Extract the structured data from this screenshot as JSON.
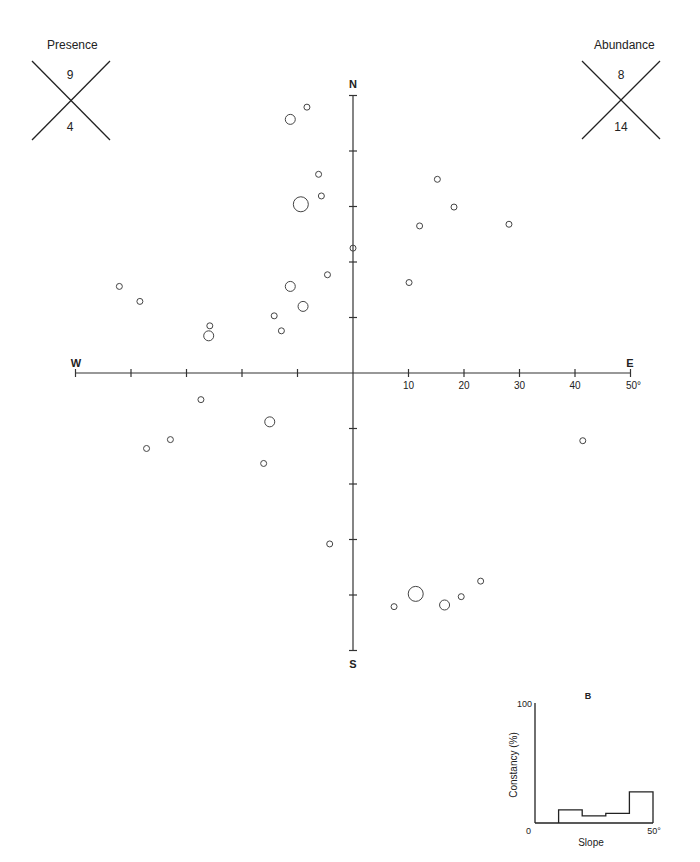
{
  "presence_key": {
    "title": "Presence",
    "upper": "9",
    "lower": "4"
  },
  "abundance_key": {
    "title": "Abundance",
    "upper": "8",
    "lower": "14"
  },
  "compass": {
    "north": "N",
    "south": "S",
    "west": "W",
    "east": "E"
  },
  "histogram": {
    "panel_label": "B",
    "ylabel": "Constancy (%)",
    "xlabel": "Slope",
    "y_top_label": "100",
    "y_zero_label": "0",
    "x_end_label": "50°"
  },
  "chart_data": [
    {
      "type": "scatter",
      "title": "",
      "description": "Polar-style aspect/slope plot: horizontal axis W–E, vertical axis N–S, distance from center = slope in degrees; circle size = abundance",
      "xlabel": "W — E",
      "ylabel": "S — N",
      "axis_tick_labels": [
        "10",
        "20",
        "30",
        "40",
        "50°"
      ],
      "axis_range": [
        -50,
        50
      ],
      "tick_step": 10,
      "grid": false,
      "size_classes": [
        "small",
        "medium",
        "large"
      ],
      "points": [
        {
          "x": -8.3,
          "y": 47.9,
          "size": "small"
        },
        {
          "x": -11.3,
          "y": 45.7,
          "size": "medium"
        },
        {
          "x": -6.2,
          "y": 35.8,
          "size": "small"
        },
        {
          "x": -5.7,
          "y": 31.9,
          "size": "small"
        },
        {
          "x": -9.4,
          "y": 30.4,
          "size": "large"
        },
        {
          "x": 0.0,
          "y": 22.5,
          "size": "small"
        },
        {
          "x": -4.6,
          "y": 17.7,
          "size": "small"
        },
        {
          "x": -11.3,
          "y": 15.6,
          "size": "medium"
        },
        {
          "x": -9.0,
          "y": 12.0,
          "size": "medium"
        },
        {
          "x": -14.2,
          "y": 10.3,
          "size": "small"
        },
        {
          "x": -12.9,
          "y": 7.6,
          "size": "small"
        },
        {
          "x": -25.8,
          "y": 8.5,
          "size": "small"
        },
        {
          "x": -26.0,
          "y": 6.7,
          "size": "medium"
        },
        {
          "x": -42.1,
          "y": 15.6,
          "size": "small"
        },
        {
          "x": -38.4,
          "y": 12.9,
          "size": "small"
        },
        {
          "x": 10.1,
          "y": 16.3,
          "size": "small"
        },
        {
          "x": 12.0,
          "y": 26.5,
          "size": "small"
        },
        {
          "x": 15.2,
          "y": 34.9,
          "size": "small"
        },
        {
          "x": 18.2,
          "y": 29.9,
          "size": "small"
        },
        {
          "x": 28.1,
          "y": 26.8,
          "size": "small"
        },
        {
          "x": -27.4,
          "y": -4.8,
          "size": "small"
        },
        {
          "x": -15.0,
          "y": -8.8,
          "size": "medium"
        },
        {
          "x": -32.9,
          "y": -12.0,
          "size": "small"
        },
        {
          "x": -37.2,
          "y": -13.6,
          "size": "small"
        },
        {
          "x": -16.1,
          "y": -16.3,
          "size": "small"
        },
        {
          "x": 41.4,
          "y": -12.2,
          "size": "small"
        },
        {
          "x": -4.2,
          "y": -30.8,
          "size": "small"
        },
        {
          "x": 11.3,
          "y": -39.8,
          "size": "large"
        },
        {
          "x": 16.5,
          "y": -41.8,
          "size": "medium"
        },
        {
          "x": 19.5,
          "y": -40.3,
          "size": "small"
        },
        {
          "x": 23.0,
          "y": -37.5,
          "size": "small"
        },
        {
          "x": 7.4,
          "y": -42.1,
          "size": "small"
        }
      ]
    },
    {
      "type": "bar",
      "title": "B",
      "description": "Step histogram of constancy by slope class",
      "xlabel": "Slope",
      "ylabel": "Constancy (%)",
      "categories": [
        "0-10",
        "10-20",
        "20-30",
        "30-40",
        "40-50"
      ],
      "values": [
        0,
        11,
        6,
        8,
        26
      ],
      "ylim": [
        0,
        100
      ],
      "xlim": [
        0,
        50
      ],
      "grid": false
    }
  ]
}
